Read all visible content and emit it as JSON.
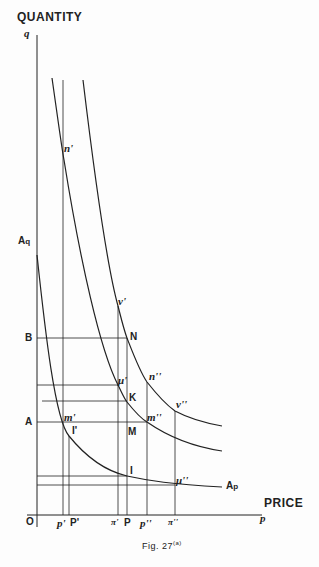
{
  "axes": {
    "y_title": "QUANTITY",
    "y_symbol": "q",
    "x_title": "PRICE",
    "x_symbol": "p",
    "origin": "O"
  },
  "caption": {
    "text": "Fig. 27",
    "superscript": "(a)"
  },
  "curves": [
    {
      "name": "A_q A_p demand curve",
      "label_start": "A",
      "label_start_sub": "q",
      "label_end": "A",
      "label_end_sub": "p"
    },
    {
      "name": "middle rectangular hyperbola",
      "points": [
        "n'",
        "μ'",
        "K",
        "m''"
      ]
    },
    {
      "name": "outer rectangular hyperbola",
      "points": [
        "ν'",
        "N",
        "n''",
        "ν''"
      ]
    }
  ],
  "y_labels": {
    "B": "B",
    "A": "A"
  },
  "x_labels": [
    "p'",
    "P'",
    "π'",
    "P",
    "p''",
    "π''"
  ],
  "point_labels": {
    "n1": "n'",
    "nu1": "ν'",
    "N": "N",
    "n2": "n''",
    "mu1": "μ'",
    "K": "K",
    "nu2": "ν''",
    "m1": "m'",
    "m2": "m''",
    "M": "M",
    "I1": "I'",
    "I": "I",
    "mu2": "μ''"
  },
  "colors": {
    "ink": "#222222",
    "paper": "#fdfdfd"
  }
}
